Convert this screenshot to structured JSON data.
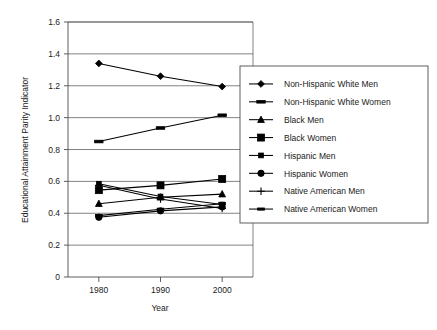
{
  "chart_data": {
    "type": "line",
    "title": "",
    "xlabel": "Year",
    "ylabel": "Educational Attainment Parity Indicator",
    "x": [
      1980,
      1990,
      2000
    ],
    "xticklabels": [
      "1980",
      "1990",
      "2000"
    ],
    "xlim": [
      1975,
      2005
    ],
    "ylim": [
      0,
      1.6
    ],
    "yticks": [
      0,
      0.2,
      0.4,
      0.6,
      0.8,
      1.0,
      1.2,
      1.4,
      1.6
    ],
    "yticklabels": [
      "0",
      "0.2",
      "0.4",
      "0.6",
      "0.8",
      "1.0",
      "1.2",
      "1.4",
      "1.6"
    ],
    "grid": "horizontal",
    "legend_position": "right-inside",
    "series": [
      {
        "name": "Non-Hispanic White Men",
        "marker": "diamond",
        "values": [
          1.34,
          1.26,
          1.195
        ]
      },
      {
        "name": "Non-Hispanic White Women",
        "marker": "dash",
        "values": [
          0.85,
          0.935,
          1.015
        ]
      },
      {
        "name": "Black Men",
        "marker": "triangle",
        "values": [
          0.46,
          0.5,
          0.52
        ]
      },
      {
        "name": "Black Women",
        "marker": "square-large",
        "values": [
          0.545,
          0.575,
          0.615
        ]
      },
      {
        "name": "Hispanic Men",
        "marker": "square-small",
        "values": [
          0.585,
          0.505,
          0.455
        ]
      },
      {
        "name": "Hispanic Women",
        "marker": "circle",
        "values": [
          0.375,
          0.415,
          0.44
        ]
      },
      {
        "name": "Native American Men",
        "marker": "plus",
        "values": [
          0.575,
          0.49,
          0.43
        ]
      },
      {
        "name": "Native American Women",
        "marker": "dash-small",
        "values": [
          0.385,
          0.425,
          0.46
        ]
      }
    ]
  }
}
